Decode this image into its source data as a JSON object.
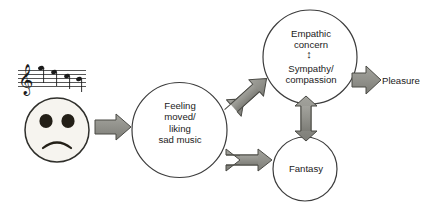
{
  "figure": {
    "type": "flow-diagram",
    "background_color": "#ffffff",
    "stroke_color": "#3c3c3c",
    "arrow_fill_color": "#8f8f8a",
    "arrow_stroke_color": "#4a4a45",
    "text_color": "#1b1b1b"
  },
  "stimulus": {
    "music_notation_label": "music-staff-with-notes",
    "note_count": 4,
    "clef": "treble",
    "face_label": "sad-face",
    "face_expression": "frown",
    "face_fill": "#f6f4ef",
    "face_eye_color": "#231f17"
  },
  "nodes": {
    "feeling": {
      "label": "Feeling\nmoved/\nliking\nsad music",
      "shape": "circle"
    },
    "empathic_concern": {
      "label": "Empathic\nconcern",
      "shape": "circle"
    },
    "sympathy": {
      "label": "Sympathy/\ncompassion"
    },
    "fantasy": {
      "label": "Fantasy",
      "shape": "circle"
    },
    "pleasure": {
      "label": "Pleasure",
      "shape": "text"
    }
  },
  "connectors": {
    "stimulus_to_feeling": {
      "name": "block-arrow-right",
      "direction": "right",
      "heads": 1
    },
    "feeling_to_empathic": {
      "name": "block-arrow-diagonal",
      "direction": "up-right / down-left",
      "heads": 2
    },
    "feeling_to_fantasy": {
      "name": "block-arrow-horizontal",
      "direction": "left-right",
      "heads": 2
    },
    "empathic_to_fantasy": {
      "name": "block-arrow-vertical",
      "direction": "up-down",
      "heads": 2
    },
    "empathic_to_pleasure": {
      "name": "block-arrow-right",
      "direction": "right",
      "heads": 1
    },
    "concern_sympathy_link": {
      "name": "double-headed-arrow-vertical",
      "glyph": "↕"
    }
  }
}
